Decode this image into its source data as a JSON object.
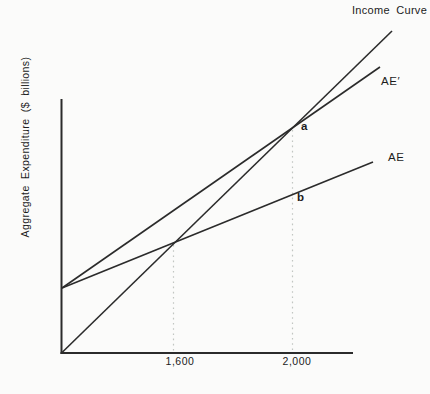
{
  "figure": {
    "ylabel": "Aggregate Expenditure ($ billions)",
    "line_labels": {
      "income_curve": "Income Curve",
      "ae_prime": "AE′",
      "ae": "AE"
    },
    "point_labels": {
      "a": "a",
      "b": "b"
    },
    "x_ticks": [
      "1,600",
      "2,000"
    ]
  },
  "chart_data": {
    "type": "line",
    "title": "",
    "xlabel": "",
    "ylabel": "Aggregate Expenditure ($ billions)",
    "x_tick_labels": [
      "1,600",
      "2,000"
    ],
    "grid": false,
    "legend_position": "labels-at-line-ends",
    "series": [
      {
        "name": "Income Curve",
        "description": "45-degree income line rising from the origin",
        "known_points_x": [
          0,
          1600,
          2000
        ],
        "known_points_y": [
          0,
          1600,
          2000
        ]
      },
      {
        "name": "AE′",
        "description": "higher aggregate expenditure line; shares y-intercept with AE; crosses Income Curve at income 2,000 (point a)",
        "equilibrium_x": 2000,
        "equilibrium_point_label": "a"
      },
      {
        "name": "AE",
        "description": "initial aggregate expenditure line; crosses Income Curve at income 1,600; point b lies on it at income 2,000",
        "equilibrium_x": 1600
      }
    ],
    "annotations": [
      {
        "label": "a",
        "x": 2000,
        "on": "intersection of AE′ and Income Curve"
      },
      {
        "label": "b",
        "x": 2000,
        "on": "AE line below point a"
      }
    ],
    "guides": [
      {
        "axis": "x",
        "value": 1600,
        "style": "dashed"
      },
      {
        "axis": "x",
        "value": 2000,
        "style": "dashed"
      }
    ],
    "colors": {
      "line": "#2b2b2b",
      "axis": "#2b2b2b",
      "guide": "#c2c6c2",
      "background": "#fbfbfa",
      "text": "#1c1c1c"
    },
    "render": {
      "axes": [
        {
          "name": "y-axis",
          "x1": 61.5,
          "y1": 99,
          "x2": 61.5,
          "y2": 354,
          "width": 2
        },
        {
          "name": "x-axis",
          "x1": 60.5,
          "y1": 353,
          "x2": 353,
          "y2": 353,
          "width": 2
        }
      ],
      "lines": [
        {
          "name": "income-curve-line",
          "x1": 61.5,
          "y1": 353,
          "x2": 392,
          "y2": 31,
          "width": 1.6
        },
        {
          "name": "ae-prime-line",
          "x1": 62,
          "y1": 288,
          "x2": 380,
          "y2": 67,
          "width": 1.6
        },
        {
          "name": "ae-line",
          "x1": 62,
          "y1": 288,
          "x2": 373,
          "y2": 162,
          "width": 1.6
        }
      ],
      "guides": [
        {
          "name": "guide-1600",
          "x1": 173.5,
          "y1": 245,
          "x2": 173.5,
          "y2": 352,
          "width": 1.2,
          "dash": "1.6 3.6"
        },
        {
          "name": "guide-2000",
          "x1": 292.5,
          "y1": 130,
          "x2": 292.5,
          "y2": 352,
          "width": 1.2,
          "dash": "1.6 3.6"
        }
      ]
    }
  }
}
